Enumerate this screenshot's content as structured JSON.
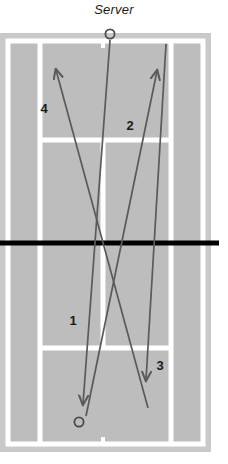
{
  "diagram": {
    "title": "Server",
    "type": "tennis-court-serve-return-diagram",
    "colors": {
      "court_surface": "#bdbdbd",
      "court_outer_band": "#c9c9c9",
      "line": "#ffffff",
      "net": "#000000",
      "arrow": "#5a5a5a",
      "text": "#1a1a1a",
      "page_background": "#ffffff"
    },
    "court": {
      "outer_left": 0,
      "outer_top": 33,
      "outer_right": 211,
      "outer_bottom": 452,
      "play_left": 8,
      "play_top": 41,
      "play_right": 203,
      "play_bottom": 444,
      "singles_left_x": 40,
      "singles_right_x": 171,
      "center_line_x": 103,
      "net_y": 243,
      "service_line_top_y": 140,
      "service_line_bottom_y": 348
    },
    "markers": [
      {
        "name": "server-position",
        "label": "Server",
        "x": 110,
        "y": 34,
        "radius": 5
      },
      {
        "name": "receiver-position",
        "label": "",
        "x": 79,
        "y": 422,
        "radius": 5
      }
    ],
    "shot_paths": [
      {
        "id": "1",
        "label": "1",
        "label_x": 73,
        "label_y": 325,
        "from_x": 110,
        "from_y": 40,
        "to_x": 83,
        "to_y": 404,
        "direction": "down",
        "description": "serve from server down the middle to deep left"
      },
      {
        "id": "2",
        "label": "2",
        "label_x": 130,
        "label_y": 130,
        "from_x": 86,
        "from_y": 416,
        "to_x": 157,
        "to_y": 71,
        "direction": "up",
        "description": "return crosscourt up to the right corner"
      },
      {
        "id": "3",
        "label": "3",
        "label_x": 160,
        "label_y": 370,
        "from_x": 166,
        "from_y": 44,
        "to_x": 146,
        "to_y": 380,
        "direction": "down",
        "description": "shot hit down the line toward the bottom"
      },
      {
        "id": "4",
        "label": "4",
        "label_x": 44,
        "label_y": 113,
        "from_x": 148,
        "from_y": 408,
        "to_x": 56,
        "to_y": 70,
        "direction": "up",
        "description": "return crosscourt up to the left corner"
      }
    ]
  }
}
